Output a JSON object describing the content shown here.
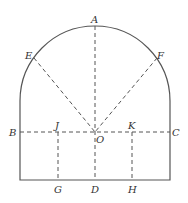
{
  "figure": {
    "points": {
      "A": "A",
      "B": "B",
      "C": "C",
      "D": "D",
      "E": "E",
      "F": "F",
      "G": "G",
      "H": "H",
      "J": "J",
      "K": "K",
      "O": "O"
    }
  }
}
